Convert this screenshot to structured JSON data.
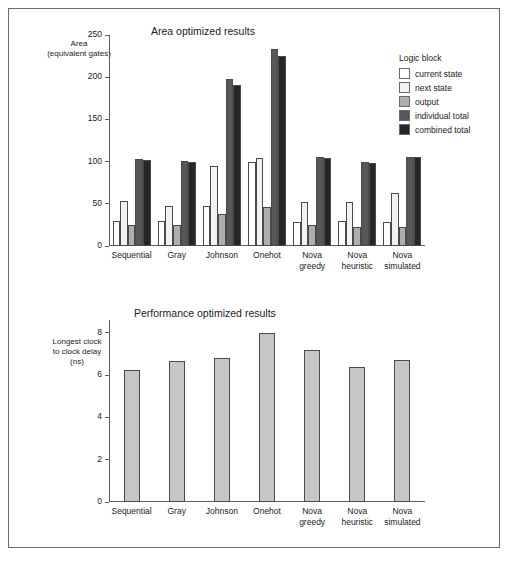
{
  "figure": {
    "border_color": "#6b6b6b",
    "background": "#ffffff"
  },
  "legend": {
    "title": "Logic block",
    "entries": [
      {
        "label": "current state",
        "color": "#ffffff"
      },
      {
        "label": "next state",
        "color": "#f2f2f2"
      },
      {
        "label": "output",
        "color": "#aeaeae"
      },
      {
        "label": "individual total",
        "color": "#575757"
      },
      {
        "label": "combined total",
        "color": "#262626"
      }
    ]
  },
  "chart_data": [
    {
      "type": "bar",
      "title": "Area optimized results",
      "ylabel": "Area\n(equivalent gates)",
      "ylabel_lines": [
        "Area",
        "(equivalent gates)"
      ],
      "xlabel": "",
      "ylim": [
        0,
        250
      ],
      "yticks": [
        0,
        50,
        100,
        150,
        200,
        250
      ],
      "grid": false,
      "legend_position": "right",
      "categories": [
        "Sequential",
        "Gray",
        "Johnson",
        "Onehot",
        "Nova greedy",
        "Nova heuristic",
        "Nova simulated"
      ],
      "category_lines": [
        [
          "Sequential"
        ],
        [
          "Gray"
        ],
        [
          "Johnson"
        ],
        [
          "Onehot"
        ],
        [
          "Nova",
          "greedy"
        ],
        [
          "Nova",
          "heuristic"
        ],
        [
          "Nova",
          "simulated"
        ]
      ],
      "series": [
        {
          "name": "current state",
          "color": "#ffffff",
          "values": [
            30,
            30,
            48,
            99,
            28,
            30,
            29
          ]
        },
        {
          "name": "next state",
          "color": "#f2f2f2",
          "values": [
            53,
            48,
            95,
            104,
            52,
            52,
            63
          ]
        },
        {
          "name": "output",
          "color": "#aeaeae",
          "values": [
            25,
            25,
            38,
            46,
            25,
            23,
            23
          ]
        },
        {
          "name": "individual total",
          "color": "#575757",
          "values": [
            103,
            101,
            198,
            234,
            105,
            100,
            106
          ]
        },
        {
          "name": "combined total",
          "color": "#262626",
          "values": [
            102,
            99,
            191,
            225,
            104,
            98,
            105
          ]
        }
      ]
    },
    {
      "type": "bar",
      "title": "Performance optimized results",
      "ylabel": "Longest clock\nto clock delay\n(ns)",
      "ylabel_lines": [
        "Longest clock",
        "to clock delay",
        "(ns)"
      ],
      "xlabel": "",
      "ylim": [
        0,
        8.6
      ],
      "yticks": [
        0,
        2,
        4,
        6,
        8
      ],
      "grid": false,
      "legend_position": "none",
      "categories": [
        "Sequential",
        "Gray",
        "Johnson",
        "Onehot",
        "Nova greedy",
        "Nova heuristic",
        "Nova simulated"
      ],
      "category_lines": [
        [
          "Sequential"
        ],
        [
          "Gray"
        ],
        [
          "Johnson"
        ],
        [
          "Onehot"
        ],
        [
          "Nova",
          "greedy"
        ],
        [
          "Nova",
          "heuristic"
        ],
        [
          "Nova",
          "simulated"
        ]
      ],
      "series": [
        {
          "name": "longest clock to clock delay",
          "color": "#c6c6c6",
          "values": [
            6.25,
            6.65,
            6.82,
            7.97,
            7.18,
            6.37,
            6.7
          ]
        }
      ]
    }
  ]
}
